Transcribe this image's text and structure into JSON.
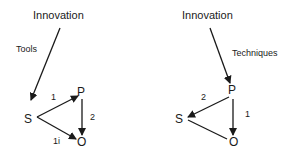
{
  "left_diagram": {
    "title": "Innovation",
    "arrow_label": "Tools",
    "nodes": {
      "s": "S",
      "p": "P",
      "o": "O"
    },
    "edges": {
      "s_to_p": "1",
      "p_to_o": "2",
      "s_to_o": "1i"
    }
  },
  "right_diagram": {
    "title": "Innovation",
    "arrow_label": "Techniques",
    "nodes": {
      "s": "S",
      "p": "P",
      "o": "O"
    },
    "edges": {
      "p_to_s": "2",
      "p_to_o": "1"
    }
  },
  "colors": {
    "ink": "#1a1a1a",
    "background": "#ffffff"
  }
}
